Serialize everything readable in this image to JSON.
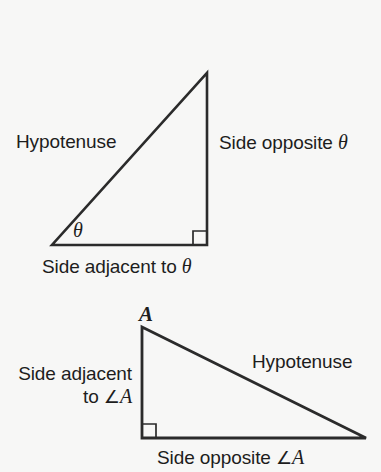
{
  "figure": {
    "background_color": "#f7f7f6",
    "stroke_color": "#2b2b2b"
  },
  "triangle_theta": {
    "name": "theta-triangle",
    "vertices": {
      "right_angle": [
        207,
        245
      ],
      "theta_angle": [
        52,
        245
      ],
      "apex": [
        207,
        73
      ]
    },
    "labels": {
      "hypotenuse": "Hypotenuse",
      "opposite_prefix": "Side opposite ",
      "opposite_symbol": "θ",
      "adjacent_prefix": "Side adjacent to ",
      "adjacent_symbol": "θ",
      "angle_mark": "θ"
    },
    "right_angle_marker": true
  },
  "triangle_a": {
    "name": "angle-a-triangle",
    "vertices": {
      "vertex_a": [
        142,
        327
      ],
      "right_angle": [
        142,
        438
      ],
      "far_vertex": [
        366,
        438
      ]
    },
    "labels": {
      "vertex": "A",
      "hypotenuse": "Hypotenuse",
      "adjacent_line1": "Side adjacent",
      "adjacent_line2_prefix": "to ",
      "adjacent_angle_symbol": "∠",
      "adjacent_vertex": "A",
      "opposite_prefix": "Side opposite ",
      "opposite_angle_symbol": "∠",
      "opposite_vertex": "A"
    },
    "right_angle_marker": true
  }
}
